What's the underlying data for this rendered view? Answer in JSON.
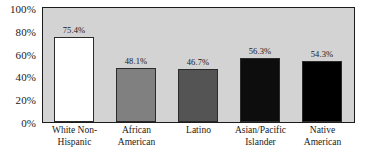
{
  "chart_data": {
    "type": "bar",
    "title": "",
    "subtitle": "",
    "xlabel": "",
    "ylabel": "",
    "categories": [
      "White Non-Hispanic",
      "African American",
      "Latino",
      "Asian/Pacific Islander",
      "Native American"
    ],
    "category_lines": [
      [
        "White Non-",
        "Hispanic"
      ],
      [
        "African",
        "American"
      ],
      [
        "Latino"
      ],
      [
        "Asian/Pacific",
        "Islander"
      ],
      [
        "Native American"
      ]
    ],
    "values": [
      75.4,
      48.1,
      46.7,
      56.3,
      54.3
    ],
    "data_labels": [
      "75.4%",
      "48.1%",
      "46.7%",
      "56.3%",
      "54.3%"
    ],
    "bar_colors": [
      "#ffffff",
      "#808080",
      "#545454",
      "#0d0d0d",
      "#000000"
    ],
    "ylim": [
      0,
      100
    ],
    "yticks": [
      0,
      20,
      40,
      60,
      80,
      100
    ],
    "ytick_labels": [
      "0%",
      "20%",
      "40%",
      "60%",
      "80%",
      "100%"
    ],
    "grid": false,
    "legend": null,
    "plot_background": "#d3d3d3",
    "axis_color": "#1c1c1c",
    "text_color": "#1a1a1a"
  }
}
